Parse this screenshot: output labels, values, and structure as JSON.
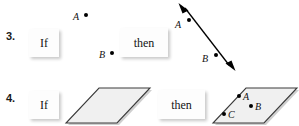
{
  "document": {
    "type": "geometry-worksheet",
    "background_color": "#ffffff"
  },
  "problems": [
    {
      "number": "3.",
      "if_label": "If",
      "then_label": "then",
      "hypothesis": {
        "kind": "two-free-points",
        "points": [
          {
            "label": "A"
          },
          {
            "label": "B"
          }
        ]
      },
      "conclusion": {
        "kind": "line-through-two-points",
        "points": [
          {
            "label": "A"
          },
          {
            "label": "B"
          }
        ]
      }
    },
    {
      "number": "4.",
      "if_label": "If",
      "then_label": "then",
      "hypothesis": {
        "kind": "plane-parallelogram",
        "points": []
      },
      "conclusion": {
        "kind": "plane-parallelogram-with-points",
        "points": [
          {
            "label": "A"
          },
          {
            "label": "B"
          },
          {
            "label": "C"
          }
        ]
      }
    }
  ],
  "colors": {
    "ink": "#111111",
    "shape_fill": "#f0f0f0",
    "shape_stroke": "#3a3a3a",
    "shadow": "rgba(0,0,0,0.22)"
  },
  "icons": {
    "double_arrow": "double-headed-arrow-icon",
    "parallelogram": "parallelogram-icon",
    "point_dot": "point-dot-icon"
  }
}
